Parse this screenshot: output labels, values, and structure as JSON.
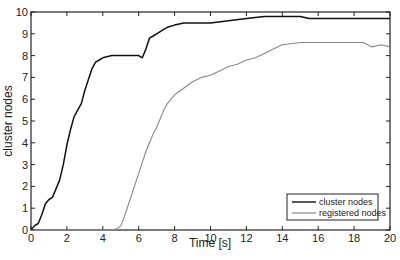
{
  "chart_data": {
    "type": "line",
    "title": "",
    "xlabel": "Time [s]",
    "ylabel": "cluster nodes",
    "xlim": [
      0,
      20
    ],
    "ylim": [
      0,
      10
    ],
    "xticks": [
      0,
      2,
      4,
      6,
      8,
      10,
      12,
      14,
      16,
      18,
      20
    ],
    "yticks": [
      0,
      1,
      2,
      3,
      4,
      5,
      6,
      7,
      8,
      9,
      10
    ],
    "grid": false,
    "legend_position": "lower right",
    "series": [
      {
        "name": "cluster nodes",
        "color": "#111111",
        "x": [
          0,
          0.2,
          0.4,
          0.6,
          0.8,
          1.0,
          1.2,
          1.4,
          1.6,
          1.8,
          2.0,
          2.2,
          2.4,
          2.6,
          2.8,
          3.0,
          3.2,
          3.4,
          3.6,
          3.8,
          4.0,
          4.5,
          5.0,
          5.5,
          6.0,
          6.2,
          6.4,
          6.6,
          6.8,
          7.0,
          7.2,
          7.4,
          7.6,
          8.0,
          8.5,
          9.0,
          10.0,
          11.0,
          12.0,
          13.0,
          14.0,
          14.5,
          15.0,
          15.5,
          16.0,
          18.0,
          20.0
        ],
        "y": [
          0,
          0.2,
          0.3,
          0.7,
          1.2,
          1.4,
          1.5,
          1.9,
          2.3,
          3.0,
          3.9,
          4.6,
          5.2,
          5.5,
          5.8,
          6.4,
          6.9,
          7.4,
          7.7,
          7.8,
          7.9,
          8.0,
          8.0,
          8.0,
          8.0,
          7.9,
          8.3,
          8.8,
          8.9,
          9.0,
          9.1,
          9.2,
          9.3,
          9.4,
          9.5,
          9.5,
          9.5,
          9.6,
          9.7,
          9.8,
          9.8,
          9.8,
          9.8,
          9.7,
          9.7,
          9.7,
          9.7
        ]
      },
      {
        "name": "registered nodes",
        "color": "#888888",
        "x": [
          0,
          4.5,
          4.8,
          5.0,
          5.2,
          5.4,
          5.6,
          5.8,
          6.0,
          6.2,
          6.4,
          6.6,
          6.8,
          7.0,
          7.2,
          7.4,
          7.6,
          7.8,
          8.0,
          8.5,
          9.0,
          9.5,
          10.0,
          10.5,
          11.0,
          11.5,
          12.0,
          12.5,
          13.0,
          13.5,
          14.0,
          15.0,
          16.0,
          17.0,
          18.0,
          18.5,
          19.0,
          19.5,
          20.0
        ],
        "y": [
          0,
          0,
          0.05,
          0.2,
          0.6,
          1.1,
          1.6,
          2.1,
          2.6,
          3.1,
          3.6,
          4.0,
          4.4,
          4.7,
          5.1,
          5.5,
          5.8,
          6.0,
          6.2,
          6.5,
          6.8,
          7.0,
          7.1,
          7.3,
          7.5,
          7.6,
          7.8,
          7.9,
          8.1,
          8.3,
          8.5,
          8.6,
          8.6,
          8.6,
          8.6,
          8.6,
          8.4,
          8.5,
          8.4
        ]
      }
    ]
  }
}
